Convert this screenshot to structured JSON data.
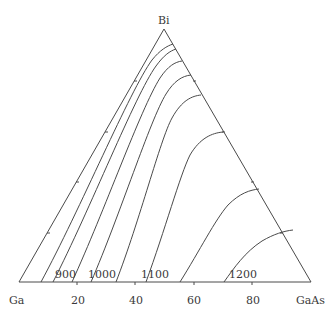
{
  "diagram": {
    "type": "ternary-phase-diagram",
    "vertices": {
      "top": "Bi",
      "bottom_left": "Ga",
      "bottom_right": "GaAs"
    },
    "base_axis_ticks": [
      "20",
      "40",
      "60",
      "80"
    ],
    "isotherm_labels": [
      "900",
      "1000",
      "1100",
      "1200"
    ],
    "colors": {
      "line": "#4a4a4a",
      "text": "#3a3a3a",
      "background": "#ffffff"
    }
  }
}
